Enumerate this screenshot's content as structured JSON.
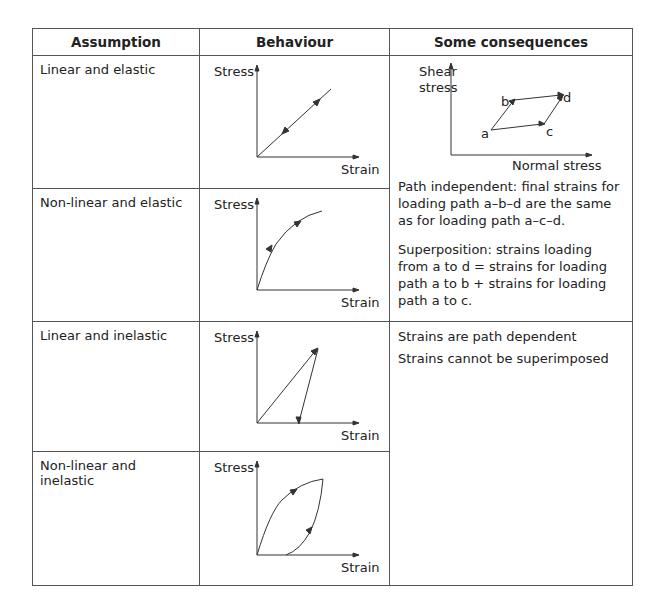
{
  "table": {
    "headers": [
      "Assumption",
      "Behaviour",
      "Some consequences"
    ],
    "rows": [
      {
        "assumption": "Linear and elastic",
        "y_axis": "Stress",
        "x_axis": "Strain"
      },
      {
        "assumption": "Non-linear and elastic",
        "y_axis": "Stress",
        "x_axis": "Strain"
      },
      {
        "assumption": "Linear and inelastic",
        "y_axis": "Stress",
        "x_axis": "Strain"
      },
      {
        "assumption": "Non-linear and inelastic",
        "y_axis": "Stress",
        "x_axis": "Strain"
      }
    ],
    "consequences_elastic": {
      "diagram": {
        "y_axis_line1": "Shear",
        "y_axis_line2": "stress",
        "x_axis": "Normal stress",
        "points": [
          "a",
          "b",
          "c",
          "d"
        ]
      },
      "paragraphs": [
        "Path independent: final strains for loading path a–b–d are the same as for loading path a–c–d.",
        "Superposition: strains loading from a to d = strains for loading path a to b + strains for loading path a to c."
      ]
    },
    "consequences_inelastic": {
      "paragraphs": [
        "Strains are path dependent",
        "Strains cannot be superimposed"
      ]
    }
  }
}
